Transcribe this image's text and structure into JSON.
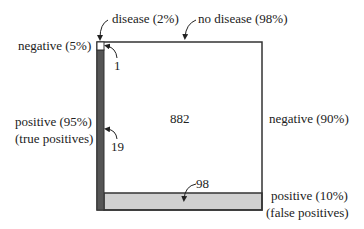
{
  "columns": {
    "disease": "disease (2%)",
    "no_disease": "no disease (98%)"
  },
  "rows_left": {
    "negative": "negative (5%)",
    "positive": "positive (95%)",
    "positive_note": "(true positives)"
  },
  "rows_right": {
    "negative": "negative (90%)",
    "positive": "positive (10%)",
    "positive_note": "(false positives)"
  },
  "counts": {
    "false_negatives": "1",
    "true_positives": "19",
    "true_negatives": "882",
    "false_positives": "98"
  },
  "colors": {
    "true_positive_fill": "#555555",
    "false_positive_fill": "#d0d0d0",
    "frame": "#333333"
  }
}
